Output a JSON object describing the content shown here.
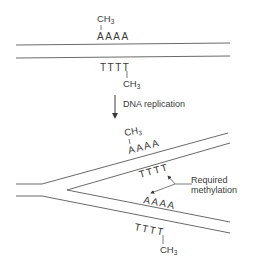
{
  "diagram": {
    "type": "DNA replication methylation schematic",
    "colors": {
      "line": "#6a6a6a",
      "text": "#3a3a3a",
      "background": "#ffffff"
    },
    "parent": {
      "top_strand": {
        "bases": "AAAA",
        "methyl_group": "CH",
        "methyl_sub": "3"
      },
      "bottom_strand": {
        "bases": "TTTT",
        "methyl_group": "CH",
        "methyl_sub": "3"
      }
    },
    "step": {
      "label": "DNA replication",
      "arrow": "down-arrow"
    },
    "daughter": {
      "upper_old_strand": {
        "bases": "AAAA",
        "methyl_group": "CH",
        "methyl_sub": "3"
      },
      "upper_new_strand": {
        "bases": "TTTT"
      },
      "lower_new_strand": {
        "bases": "AAAA"
      },
      "lower_old_strand": {
        "bases": "TTTT",
        "methyl_group": "CH",
        "methyl_sub": "3"
      }
    },
    "annotation": {
      "line1": "Required",
      "line2": "methylation"
    }
  }
}
